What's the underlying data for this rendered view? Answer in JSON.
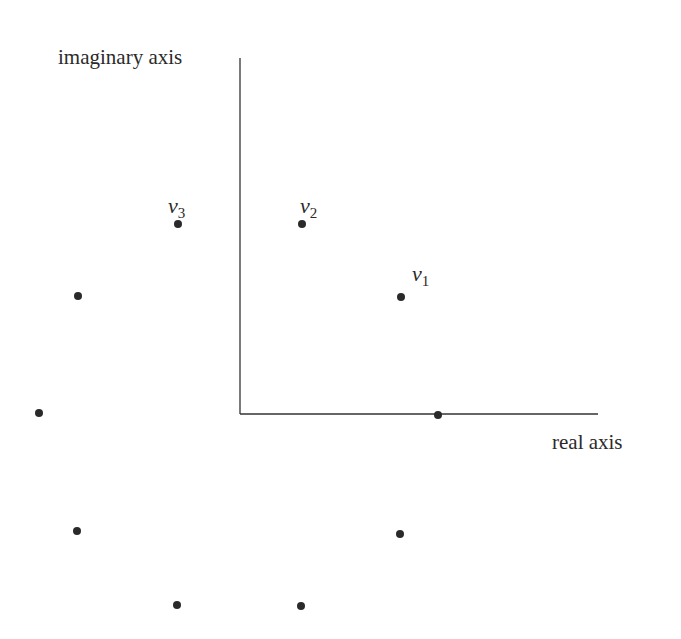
{
  "diagram": {
    "axes": {
      "imaginary_label": "imaginary axis",
      "real_label": "real axis",
      "origin": [
        240,
        414
      ],
      "vertical_top": 58,
      "horizontal_right": 598
    },
    "points": [
      {
        "x": 401,
        "y": 297,
        "label": "v",
        "sub": "1"
      },
      {
        "x": 302,
        "y": 224,
        "label": "v",
        "sub": "2"
      },
      {
        "x": 178,
        "y": 224,
        "label": "v",
        "sub": "3"
      },
      {
        "x": 78,
        "y": 296,
        "label": "",
        "sub": ""
      },
      {
        "x": 39,
        "y": 413,
        "label": "",
        "sub": ""
      },
      {
        "x": 77,
        "y": 531,
        "label": "",
        "sub": ""
      },
      {
        "x": 177,
        "y": 605,
        "label": "",
        "sub": ""
      },
      {
        "x": 301,
        "y": 606,
        "label": "",
        "sub": ""
      },
      {
        "x": 400,
        "y": 534,
        "label": "",
        "sub": ""
      },
      {
        "x": 438,
        "y": 415,
        "label": "",
        "sub": ""
      }
    ],
    "colors": {
      "ink": "#2a2a2a",
      "background": "#ffffff"
    }
  }
}
